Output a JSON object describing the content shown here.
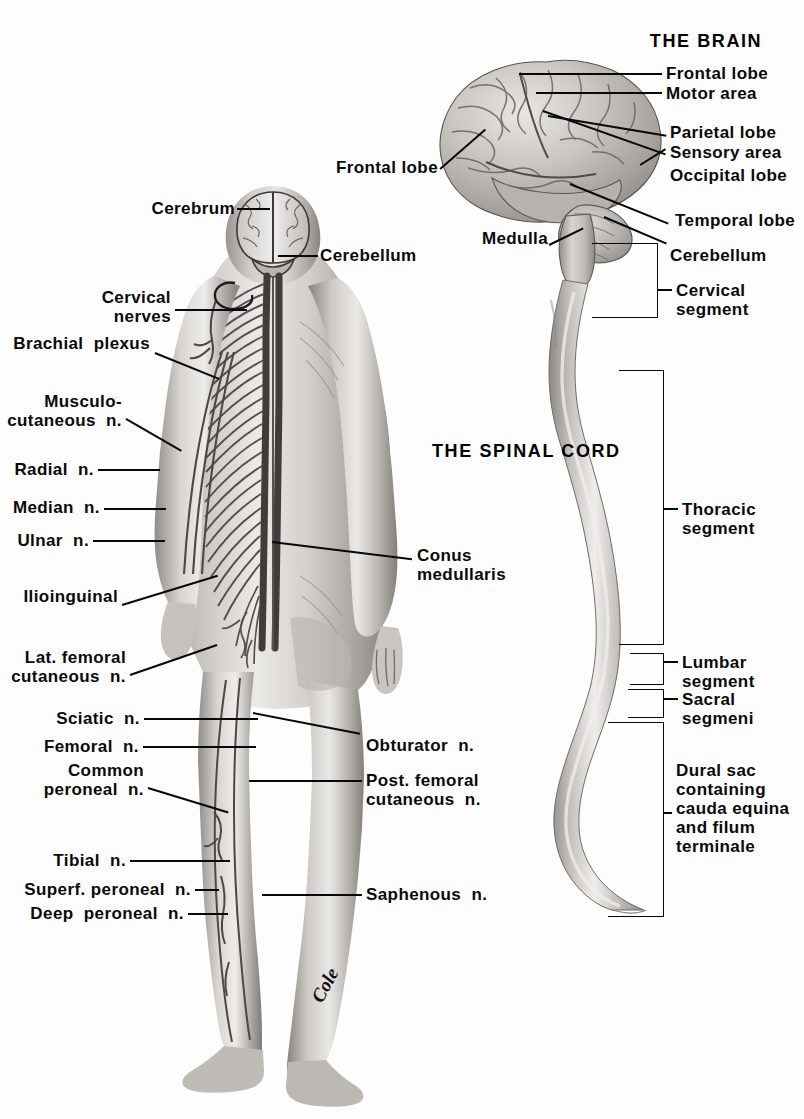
{
  "figure": {
    "caption_brain": "THE BRAIN",
    "caption_cord": "THE SPINAL CORD",
    "signature": "Cole"
  },
  "brain_labels": {
    "frontal_lobe_right": "Frontal lobe",
    "motor_area": "Motor area",
    "parietal_lobe": "Parietal lobe",
    "sensory_area": "Sensory area",
    "occipital_lobe": "Occipital lobe",
    "temporal_lobe": "Temporal lobe",
    "cerebellum": "Cerebellum",
    "frontal_lobe_left": "Frontal lobe",
    "medulla": "Medulla"
  },
  "cord_labels": {
    "cervical_segment": "Cervical\nsegment",
    "thoracic_segment": "Thoracic\nsegment",
    "lumbar_segment": "Lumbar\nsegment",
    "sacral_segment": "Sacral\nsegmeni",
    "dural_sac": "Dural sac\ncontaining\ncauda equina\nand filum\nterminale"
  },
  "body_labels_left": [
    {
      "id": "cerebrum",
      "text": "Cerebrum"
    },
    {
      "id": "cervical-nerves",
      "text": "Cervical\nnerves"
    },
    {
      "id": "brachial-plexus",
      "text": "Brachial  plexus"
    },
    {
      "id": "musculocutaneous-n",
      "text": "Musculo-\ncutaneous  n."
    },
    {
      "id": "radial-n",
      "text": "Radial  n."
    },
    {
      "id": "median-n",
      "text": "Median  n."
    },
    {
      "id": "ulnar-n",
      "text": "Ulnar  n."
    },
    {
      "id": "ilioinguinal",
      "text": "Ilioinguinal"
    },
    {
      "id": "lat-femoral-cutaneous-n",
      "text": "Lat. femoral\ncutaneous  n."
    },
    {
      "id": "sciatic-n",
      "text": "Sciatic  n."
    },
    {
      "id": "femoral-n",
      "text": "Femoral  n."
    },
    {
      "id": "common-peroneal-n",
      "text": "Common\nperoneal  n."
    },
    {
      "id": "tibial-n",
      "text": "Tibial  n."
    },
    {
      "id": "superf-peroneal-n",
      "text": "Superf. peroneal  n."
    },
    {
      "id": "deep-peroneal-n",
      "text": "Deep  peroneal  n."
    }
  ],
  "body_labels_right": [
    {
      "id": "cerebellum",
      "text": "Cerebellum"
    },
    {
      "id": "conus-medullaris",
      "text": "Conus\nmedullaris"
    },
    {
      "id": "obturator-n",
      "text": "Obturator  n."
    },
    {
      "id": "post-femoral-cutaneous-n",
      "text": "Post. femoral\ncutaneous  n."
    },
    {
      "id": "saphenous-n",
      "text": "Saphenous  n."
    }
  ],
  "colors": {
    "ink": "#080808",
    "background": "#fdfdfd",
    "skin_light": "#e7e5e2",
    "skin_mid": "#bdbab6",
    "skin_dark": "#8e8b88",
    "skin_shadow": "#6d6a67",
    "nerve": "#4a4745",
    "brain_light": "#dedbd7",
    "brain_mid": "#b4b1ad",
    "brain_dark": "#827f7b",
    "cord_light": "#dddad6",
    "cord_mid": "#aaa7a3"
  }
}
